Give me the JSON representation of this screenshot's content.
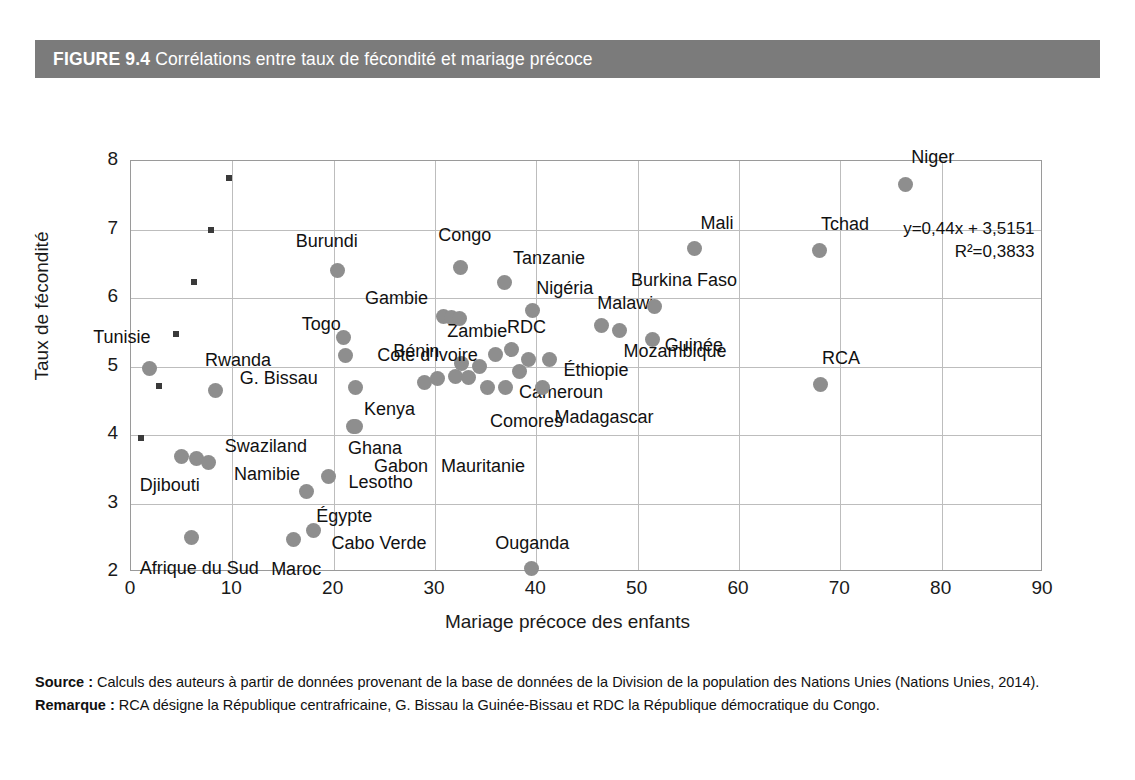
{
  "figure": {
    "label": "FIGURE 9.4",
    "title": "Corrélations entre taux de fécondité et mariage précoce"
  },
  "notes": {
    "source_label": "Source :",
    "source_text": " Calculs des auteurs à partir de données provenant de la base de données de la Division de la population des Nations Unies (Nations Unies, 2014).",
    "remark_label": "Remarque :",
    "remark_text": " RCA désigne la République centrafricaine, G. Bissau la Guinée-Bissau et RDC la République démocratique du Congo."
  },
  "chart_data": {
    "type": "scatter",
    "title": "Corrélations entre taux de fécondité et mariage précoce",
    "xlabel": "Mariage précoce des enfants",
    "ylabel": "Taux de fécondité",
    "xlim": [
      0,
      90
    ],
    "ylim": [
      2,
      8
    ],
    "xticks": [
      0,
      10,
      20,
      30,
      40,
      50,
      60,
      70,
      80,
      90
    ],
    "yticks": [
      2,
      3,
      4,
      5,
      6,
      7,
      8
    ],
    "grid": true,
    "legend": "none",
    "point_color": "#8e8e8e",
    "trendline": {
      "style": "dotted",
      "color": "#3a3a3a",
      "slope": 0.44,
      "intercept": 3.5151,
      "equation": "y=0,44x + 3,5151",
      "r2_label": "R²=0,3833",
      "r2": 0.3833,
      "x_start": 1.0,
      "x_end": 80.5
    },
    "points": [
      {
        "name": "Tunisie",
        "x": 1.8,
        "y": 4.97,
        "lx": -56,
        "ly": -32
      },
      {
        "name": "Rwanda",
        "x": 8.3,
        "y": 4.65,
        "lx": -10,
        "ly": -30
      },
      {
        "name": "Djibouti",
        "x": 5.0,
        "y": 3.68,
        "lx": -42,
        "ly": 28
      },
      {
        "name": "Swaziland",
        "x": 6.5,
        "y": 3.65,
        "lx": 28,
        "ly": -13
      },
      {
        "name": "Namibie",
        "x": 7.6,
        "y": 3.6,
        "lx": 26,
        "ly": 12
      },
      {
        "name": "Afrique du Sud",
        "x": 6.0,
        "y": 2.5,
        "lx": -52,
        "ly": 30
      },
      {
        "name": "Maroc",
        "x": 16.0,
        "y": 2.48,
        "lx": -22,
        "ly": 30
      },
      {
        "name": "Cabo Verde",
        "x": 18.0,
        "y": 2.6,
        "lx": 18,
        "ly": 12
      },
      {
        "name": "Égypte",
        "x": 17.3,
        "y": 3.17,
        "lx": 10,
        "ly": 24
      },
      {
        "name": "Lesotho",
        "x": 19.5,
        "y": 3.4,
        "lx": 20,
        "ly": 6
      },
      {
        "name": "Burundi",
        "x": 20.4,
        "y": 6.4,
        "lx": -42,
        "ly": -30
      },
      {
        "name": "Togo",
        "x": 21.0,
        "y": 5.42,
        "lx": -42,
        "ly": -14
      },
      {
        "name": "G. Bissau",
        "x": 21.2,
        "y": 5.16,
        "lx": -106,
        "ly": 22
      },
      {
        "name": "Kenya",
        "x": 22.2,
        "y": 4.7,
        "lx": 8,
        "ly": 22
      },
      {
        "name": "Ghana",
        "x": 22.0,
        "y": 4.13,
        "lx": -6,
        "ly": 22
      },
      {
        "name": "Gabon",
        "x": 22.2,
        "y": 4.13,
        "lx": 18,
        "ly": 40
      },
      {
        "name": "Gambie",
        "x": 30.8,
        "y": 5.73,
        "lx": -78,
        "ly": -18
      },
      {
        "name": "Zambie",
        "x": 31.6,
        "y": 5.72,
        "lx": -4,
        "ly": 14
      },
      {
        "name": "Congo",
        "x": 32.5,
        "y": 6.45,
        "lx": -22,
        "ly": -32
      },
      {
        "name": "Tanzanie",
        "x": 36.9,
        "y": 6.23,
        "lx": 8,
        "ly": -24
      },
      {
        "name": "Nigéria",
        "x": 39.6,
        "y": 5.82,
        "lx": 4,
        "ly": -22
      },
      {
        "name": "Bénin",
        "x": 32.0,
        "y": 4.85,
        "lx": -62,
        "ly": -26
      },
      {
        "name": "Cote d'Ivoire",
        "x": 32.6,
        "y": 5.05,
        "lx": -84,
        "ly": -8
      },
      {
        "name": "RDC",
        "x": 37.5,
        "y": 5.25,
        "lx": -4,
        "ly": -22
      },
      {
        "name": "Cameroun",
        "x": 38.3,
        "y": 4.92,
        "lx": 0,
        "ly": 20
      },
      {
        "name": "Comores",
        "x": 37.0,
        "y": 4.7,
        "lx": -16,
        "ly": 34
      },
      {
        "name": "Éthiopie",
        "x": 41.3,
        "y": 5.1,
        "lx": 14,
        "ly": 10
      },
      {
        "name": "Madagascar",
        "x": 40.6,
        "y": 4.7,
        "lx": 12,
        "ly": 30
      },
      {
        "name": "Malawi",
        "x": 46.4,
        "y": 5.6,
        "lx": -4,
        "ly": -22
      },
      {
        "name": "Mozambique",
        "x": 48.2,
        "y": 5.52,
        "lx": 4,
        "ly": 20
      },
      {
        "name": "Burkina Faso",
        "x": 51.7,
        "y": 5.88,
        "lx": -24,
        "ly": -26
      },
      {
        "name": "Guinée",
        "x": 51.5,
        "y": 5.4,
        "lx": 12,
        "ly": 6
      },
      {
        "name": "Mali",
        "x": 55.6,
        "y": 6.72,
        "lx": 6,
        "ly": -26
      },
      {
        "name": "Tchad",
        "x": 67.9,
        "y": 6.7,
        "lx": 2,
        "ly": -26
      },
      {
        "name": "RCA",
        "x": 68.0,
        "y": 4.74,
        "lx": 2,
        "ly": -26
      },
      {
        "name": "Niger",
        "x": 76.4,
        "y": 7.65,
        "lx": 6,
        "ly": -28
      },
      {
        "name": "Ouganda",
        "x": 39.5,
        "y": 2.05,
        "lx": -36,
        "ly": -26
      },
      {
        "name": "Mauritanie",
        "x": -1,
        "y": -1,
        "lx": 0,
        "ly": 0,
        "label_only": true,
        "label_px": 310,
        "label_py": 296
      },
      {
        "name": "Zambie2",
        "x": 32.4,
        "y": 5.7,
        "hide_label": true
      },
      {
        "name": "Benin2",
        "x": 33.3,
        "y": 4.84,
        "hide_label": true
      },
      {
        "name": "Mid1",
        "x": 34.4,
        "y": 5.0,
        "hide_label": true
      },
      {
        "name": "Mid2",
        "x": 35.2,
        "y": 4.7,
        "hide_label": true
      },
      {
        "name": "Mid3",
        "x": 36.0,
        "y": 5.18,
        "hide_label": true
      },
      {
        "name": "Mid4",
        "x": 30.2,
        "y": 4.82,
        "hide_label": true
      },
      {
        "name": "Mid5",
        "x": 29.0,
        "y": 4.76,
        "hide_label": true
      },
      {
        "name": "Mid6",
        "x": 39.2,
        "y": 5.1,
        "hide_label": true
      }
    ]
  }
}
